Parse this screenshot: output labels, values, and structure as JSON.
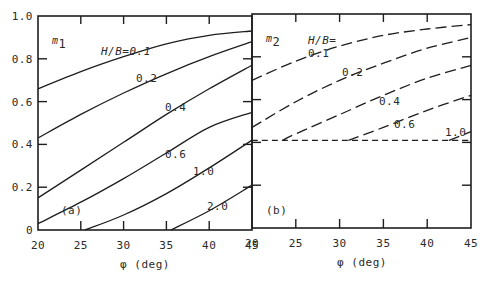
{
  "chart_data": [
    {
      "type": "line",
      "panel_label": "(a)",
      "ylabel": "m1",
      "ylabel_main": "m",
      "ylabel_sub": "1",
      "xlabel": "φ (deg)",
      "xlim": [
        20,
        45
      ],
      "ylim": [
        0,
        1.0
      ],
      "xticks": [
        "20",
        "25",
        "30",
        "35",
        "40",
        "45"
      ],
      "yticks": [
        "0",
        "0.2",
        "0.4",
        "0.6",
        "0.8",
        "1.0"
      ],
      "line_style": "solid",
      "grid": false,
      "series": [
        {
          "name": "H/B=0.1",
          "label": "H/B=0.1",
          "x": [
            20,
            25,
            30,
            35,
            40,
            45
          ],
          "y": [
            0.66,
            0.74,
            0.81,
            0.87,
            0.91,
            0.93
          ]
        },
        {
          "name": "0.2",
          "label": "0.2",
          "x": [
            20,
            25,
            30,
            35,
            40,
            45
          ],
          "y": [
            0.43,
            0.54,
            0.64,
            0.73,
            0.81,
            0.88
          ]
        },
        {
          "name": "0.4",
          "label": "0.4",
          "x": [
            20,
            25,
            30,
            35,
            40,
            45
          ],
          "y": [
            0.15,
            0.28,
            0.41,
            0.54,
            0.66,
            0.77
          ]
        },
        {
          "name": "0.6",
          "label": "0.6",
          "x": [
            20,
            25,
            30,
            35,
            40,
            45
          ],
          "y": [
            0.03,
            0.13,
            0.24,
            0.36,
            0.48,
            0.55
          ]
        },
        {
          "name": "1.0",
          "label": "1.0",
          "x": [
            25.5,
            30,
            35,
            40,
            45
          ],
          "y": [
            0.0,
            0.07,
            0.17,
            0.29,
            0.42
          ]
        },
        {
          "name": "2.0",
          "label": "2.0",
          "x": [
            35.5,
            40,
            45
          ],
          "y": [
            0.0,
            0.09,
            0.21
          ]
        }
      ]
    },
    {
      "type": "line",
      "panel_label": "(b)",
      "ylabel": "m2",
      "ylabel_main": "m",
      "ylabel_sub": "2",
      "xlabel": "φ (deg)",
      "xlim": [
        20,
        45
      ],
      "ylim": [
        0,
        1.0
      ],
      "xticks": [
        "20",
        "25",
        "30",
        "35",
        "40",
        "45"
      ],
      "yticks": [],
      "line_style": "dashed",
      "grid": false,
      "legend_prefix": "H/B=",
      "series": [
        {
          "name": "0.1",
          "label": "0.1",
          "x": [
            20,
            25,
            30,
            35,
            40,
            45
          ],
          "y": [
            0.69,
            0.78,
            0.85,
            0.9,
            0.93,
            0.95
          ]
        },
        {
          "name": "0.2",
          "label": "0.2",
          "x": [
            20,
            25,
            30,
            35,
            40,
            45
          ],
          "y": [
            0.47,
            0.59,
            0.69,
            0.77,
            0.84,
            0.89
          ]
        },
        {
          "name": "0.4",
          "label": "0.4",
          "x": [
            23.5,
            25,
            30,
            35,
            40,
            45
          ],
          "y": [
            0.41,
            0.44,
            0.53,
            0.62,
            0.7,
            0.76
          ]
        },
        {
          "name": "0.6",
          "label": "0.6",
          "x": [
            31,
            35,
            40,
            45
          ],
          "y": [
            0.41,
            0.47,
            0.55,
            0.62
          ]
        },
        {
          "name": "1.0",
          "label": "1.0",
          "x": [
            42.5,
            45
          ],
          "y": [
            0.41,
            0.45
          ]
        },
        {
          "name": "baseline",
          "label": "",
          "x": [
            20,
            45
          ],
          "y": [
            0.41,
            0.41
          ],
          "style": "shortdash"
        }
      ]
    }
  ]
}
